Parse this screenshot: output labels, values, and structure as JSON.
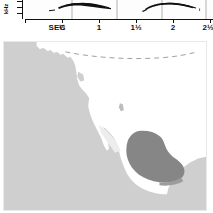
{
  "figure": {
    "kind": "field-guide-plate",
    "panels": [
      "song-spectrogram",
      "range-map"
    ]
  },
  "spectrogram": {
    "y_axis_label": "kHz",
    "x_axis_label": "SEC",
    "x_tick_labels": [
      "SEC",
      "½",
      "1",
      "1½",
      "2",
      "2½"
    ],
    "x_tick_positions_sec": [
      0,
      0.5,
      1,
      1.5,
      2,
      2.5
    ],
    "y_ticks_count": 3,
    "trace_color": "#111111",
    "panel_divider_color": "#9a9a9a",
    "phrases": [
      {
        "name": "phrase-1",
        "start_sec": 0.32,
        "end_sec": 0.82,
        "shape": "short-tick-then-descending-buzzy-slur"
      },
      {
        "name": "phrase-2",
        "start_sec": 1.58,
        "end_sec": 2.05,
        "shape": "short-tick-then-descending-buzzy-slur"
      }
    ]
  },
  "map": {
    "region": "North America (United States, Mexico, Baja California)",
    "ocean_color": "#cfcfcf",
    "land_color": "#ffffff",
    "range_color": "#868686",
    "border_color": "#e9e9e9",
    "dashed_border_label": "international-border-dashed",
    "range_description": "shaded breeding range over south-central Texas and northeastern Mexico"
  }
}
